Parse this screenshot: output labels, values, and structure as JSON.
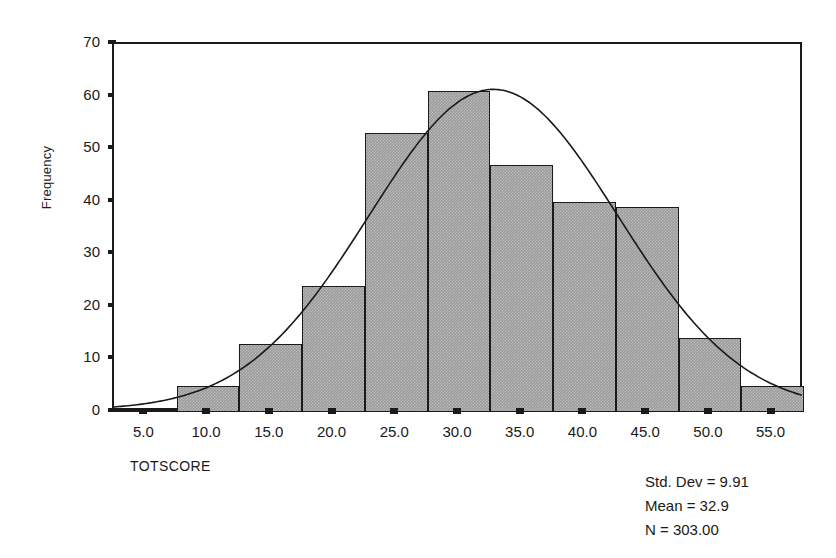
{
  "chart_data": {
    "type": "bar",
    "title": "",
    "subtitle": "",
    "xlabel": "TOTSCORE",
    "ylabel": "Frequency",
    "xlim": [
      2.5,
      57.5
    ],
    "ylim": [
      0,
      70
    ],
    "grid": false,
    "legend_position": "none",
    "x_ticks": [
      "5.0",
      "10.0",
      "15.0",
      "20.0",
      "25.0",
      "30.0",
      "35.0",
      "40.0",
      "45.0",
      "50.0",
      "55.0"
    ],
    "x_tick_values": [
      5,
      10,
      15,
      20,
      25,
      30,
      35,
      40,
      45,
      50,
      55
    ],
    "y_ticks": [
      "0",
      "10",
      "20",
      "30",
      "40",
      "50",
      "60",
      "70"
    ],
    "y_tick_values": [
      0,
      10,
      20,
      30,
      40,
      50,
      60,
      70
    ],
    "bin_width": 5,
    "bin_edges": [
      2.5,
      7.5,
      12.5,
      17.5,
      22.5,
      27.5,
      32.5,
      37.5,
      42.5,
      47.5,
      52.5,
      57.5
    ],
    "bin_centers": [
      5,
      10,
      15,
      20,
      25,
      30,
      35,
      40,
      45,
      50,
      55
    ],
    "categories": [
      "5.0",
      "10.0",
      "15.0",
      "20.0",
      "25.0",
      "30.0",
      "35.0",
      "40.0",
      "45.0",
      "50.0",
      "55.0"
    ],
    "values": [
      0,
      5,
      13,
      24,
      53,
      61,
      47,
      40,
      39,
      14,
      5
    ],
    "overlay": {
      "type": "normal-curve",
      "mean": 32.9,
      "std_dev": 9.91,
      "n": 303,
      "bin_width": 5,
      "peak_value": 61
    },
    "annotations": [
      "Std. Dev = 9.91",
      "Mean = 32.9",
      "N = 303.00"
    ]
  },
  "axes": {
    "y_label": "Frequency",
    "x_label": "TOTSCORE"
  },
  "stats": {
    "std_dev": "Std. Dev = 9.91",
    "mean": "Mean = 32.9",
    "n": "N = 303.00"
  },
  "colors": {
    "bar_fill": "#9a9a9a",
    "bar_edge": "#1a1a1a",
    "curve": "#1a1a1a",
    "axis": "#1a1a1a",
    "background": "#ffffff"
  }
}
